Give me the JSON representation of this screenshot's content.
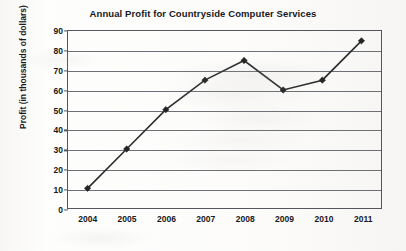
{
  "chart_data": {
    "type": "line",
    "title": "Annual Profit for Countryside Computer Services",
    "xlabel": "",
    "ylabel": "Profit (in thousands of dollars)",
    "categories": [
      "2004",
      "2005",
      "2006",
      "2007",
      "2008",
      "2009",
      "2010",
      "2011"
    ],
    "values": [
      10,
      30,
      50,
      65,
      75,
      60,
      65,
      85
    ],
    "series": [
      {
        "name": "Annual Profit",
        "values": [
          10,
          30,
          50,
          65,
          75,
          60,
          65,
          85
        ]
      }
    ],
    "ylim": [
      0,
      90
    ],
    "ytick_step": 10,
    "yticks": [
      "0",
      "10",
      "20",
      "30",
      "40",
      "50",
      "60",
      "70",
      "80",
      "90"
    ],
    "grid": "horizontal",
    "legend": "none",
    "marker": "diamond",
    "colors": {
      "line": "#2b2c2e",
      "marker": "#232426",
      "gridline": "#6d7074",
      "frame": "#53565a",
      "text": "#17181a",
      "background": "#fdfdfc"
    }
  }
}
